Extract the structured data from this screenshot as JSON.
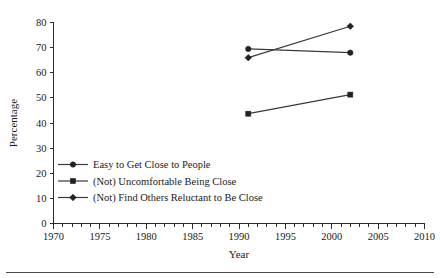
{
  "chart_data": {
    "type": "line",
    "title": "",
    "xlabel": "Year",
    "ylabel": "Percentage",
    "xlim": [
      1970,
      2010
    ],
    "ylim": [
      0,
      80
    ],
    "grid": false,
    "legend_position": "inside-lower-left",
    "x_ticks": [
      1970,
      1975,
      1980,
      1985,
      1990,
      1995,
      2000,
      2005,
      2010
    ],
    "x_tick_labels": [
      "1970",
      "1975",
      "1980",
      "1985",
      "1990",
      "1995",
      "2000",
      "2005",
      "2010"
    ],
    "x_minor_tick_step": 1,
    "y_ticks": [
      0,
      10,
      20,
      30,
      40,
      50,
      60,
      70,
      80
    ],
    "y_tick_labels": [
      "0",
      "10",
      "20",
      "30",
      "40",
      "50",
      "60",
      "70",
      "80"
    ],
    "x": [
      1991,
      2002
    ],
    "series": [
      {
        "name": "Easy to Get Close to People",
        "marker": "circle",
        "color": "#222222",
        "x": [
          1991,
          2002
        ],
        "values": [
          69.5,
          68.0
        ]
      },
      {
        "name": "(Not) Uncomfortable Being Close",
        "marker": "square",
        "color": "#222222",
        "x": [
          1991,
          2002
        ],
        "values": [
          43.7,
          51.3
        ]
      },
      {
        "name": "(Not) Find Others Reluctant to Be Close",
        "marker": "diamond",
        "color": "#222222",
        "x": [
          1991,
          2002
        ],
        "values": [
          66.0,
          78.5
        ]
      }
    ]
  },
  "axes": {
    "y_title": "Percentage",
    "x_title": "Year"
  },
  "legend": {
    "items": [
      {
        "label": "Easy to Get Close to People"
      },
      {
        "label": "(Not) Uncomfortable Being Close"
      },
      {
        "label": "(Not) Find Others Reluctant to Be Close"
      }
    ]
  }
}
